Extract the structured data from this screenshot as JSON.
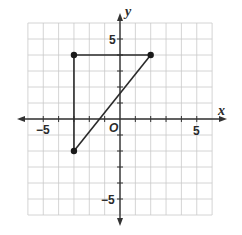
{
  "chart_data": {
    "type": "scatter",
    "title": "",
    "xlabel": "x",
    "ylabel": "y",
    "origin_label": "O",
    "xlim": [
      -6,
      6
    ],
    "ylim": [
      -6,
      6
    ],
    "grid": true,
    "tick_labels": {
      "x": [
        {
          "value": -5,
          "label": "−5"
        },
        {
          "value": 5,
          "label": "5"
        }
      ],
      "y": [
        {
          "value": 5,
          "label": "5"
        },
        {
          "value": -5,
          "label": "−5"
        }
      ]
    },
    "points": [
      {
        "x": -3,
        "y": 4
      },
      {
        "x": 2,
        "y": 4
      },
      {
        "x": -3,
        "y": -2
      }
    ],
    "segments": [
      {
        "from": [
          -3,
          4
        ],
        "to": [
          2,
          4
        ]
      },
      {
        "from": [
          -3,
          4
        ],
        "to": [
          -3,
          -2
        ]
      },
      {
        "from": [
          -3,
          -2
        ],
        "to": [
          2,
          4
        ]
      }
    ],
    "shape": "triangle"
  }
}
